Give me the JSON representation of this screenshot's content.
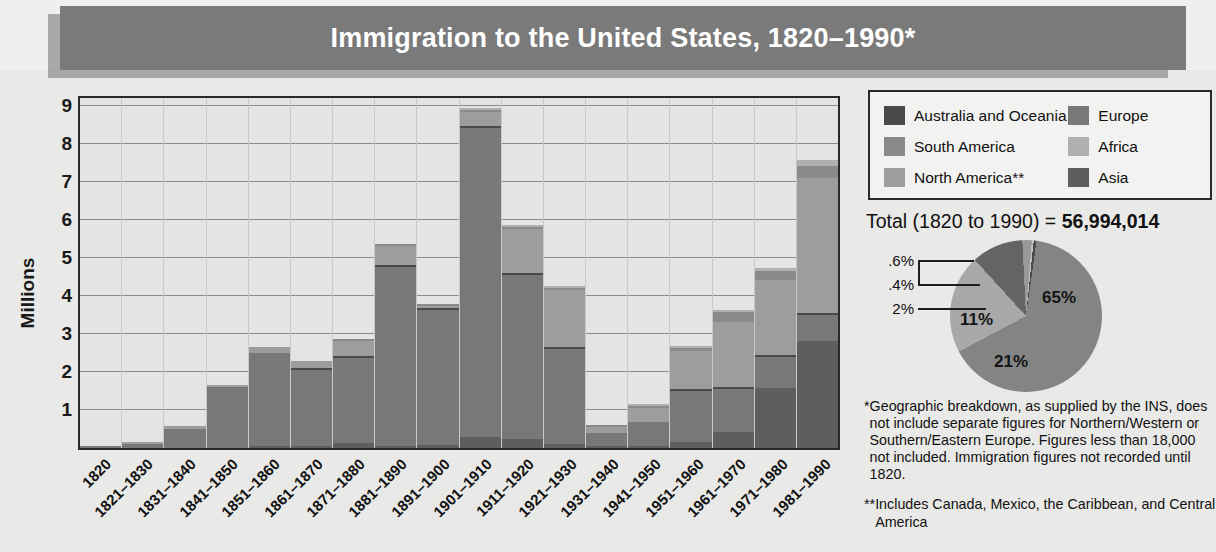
{
  "title": "Immigration to the United States, 1820–1990*",
  "axes": {
    "ylabel": "Millions",
    "yticks": [
      "9",
      "8",
      "7",
      "6",
      "5",
      "4",
      "3",
      "2",
      "1"
    ]
  },
  "legend": {
    "items": [
      {
        "label": "Australia and Oceania",
        "color": "#4a4a4a"
      },
      {
        "label": "Europe",
        "color": "#787878"
      },
      {
        "label": "South America",
        "color": "#8a8a8a"
      },
      {
        "label": "Africa",
        "color": "#b0b0b0"
      },
      {
        "label": "North America**",
        "color": "#9d9d9d"
      },
      {
        "label": "Asia",
        "color": "#5e5e5e"
      }
    ]
  },
  "total": {
    "prefix": "Total (1820 to 1990) = ",
    "value": "56,994,014"
  },
  "footnotes": [
    {
      "mark": "*",
      "text": "Geographic breakdown, as supplied by the INS, does not include separate figures for Northern/Western or Southern/Eastern Europe. Figures less than 18,000 not included. Immigration figures not recorded until 1820."
    },
    {
      "mark": "**",
      "text": "Includes Canada, Mexico, the Caribbean, and Central America"
    }
  ],
  "chart_data": [
    {
      "type": "bar",
      "subtype": "stacked",
      "title": "Immigration to the United States, 1820–1990*",
      "xlabel": "",
      "ylabel": "Millions",
      "ylim": [
        0,
        9.2
      ],
      "grid": true,
      "legend_position": "top-right",
      "categories": [
        "1820",
        "1821–1830",
        "1831–1840",
        "1841–1850",
        "1851–1860",
        "1861–1870",
        "1871–1880",
        "1881–1890",
        "1891–1900",
        "1901–1910",
        "1911–1920",
        "1921–1930",
        "1931–1940",
        "1941–1950",
        "1951–1960",
        "1961–1970",
        "1971–1980",
        "1981–1990"
      ],
      "series": [
        {
          "name": "Asia",
          "color": "#5e5e5e",
          "values": [
            0.0,
            0.0,
            0.0,
            0.0,
            0.04,
            0.06,
            0.12,
            0.06,
            0.07,
            0.3,
            0.25,
            0.11,
            0.02,
            0.04,
            0.15,
            0.43,
            1.59,
            2.8
          ]
        },
        {
          "name": "Europe",
          "color": "#787878",
          "values": [
            0.01,
            0.1,
            0.5,
            1.6,
            2.45,
            2.0,
            2.25,
            4.7,
            3.55,
            8.1,
            4.3,
            2.48,
            0.35,
            0.62,
            1.35,
            1.12,
            0.8,
            0.7
          ]
        },
        {
          "name": "Australia and Oceania",
          "color": "#4a4a4a",
          "values": [
            0.0,
            0.0,
            0.0,
            0.0,
            0.0,
            0.01,
            0.01,
            0.01,
            0.01,
            0.01,
            0.01,
            0.01,
            0.0,
            0.0,
            0.01,
            0.03,
            0.04,
            0.04
          ]
        },
        {
          "name": "North America**",
          "color": "#9d9d9d",
          "values": [
            0.0,
            0.02,
            0.08,
            0.06,
            0.16,
            0.17,
            0.4,
            0.5,
            0.04,
            0.38,
            1.15,
            1.52,
            0.16,
            0.38,
            1.0,
            1.72,
            1.98,
            3.55
          ]
        },
        {
          "name": "South America",
          "color": "#8a8a8a",
          "values": [
            0.0,
            0.0,
            0.0,
            0.0,
            0.0,
            0.0,
            0.01,
            0.01,
            0.01,
            0.02,
            0.04,
            0.04,
            0.01,
            0.02,
            0.08,
            0.26,
            0.24,
            0.3
          ]
        },
        {
          "name": "Africa",
          "color": "#b0b0b0",
          "values": [
            0.0,
            0.0,
            0.0,
            0.0,
            0.0,
            0.0,
            0.0,
            0.0,
            0.0,
            0.01,
            0.01,
            0.01,
            0.0,
            0.01,
            0.01,
            0.03,
            0.08,
            0.18
          ]
        }
      ],
      "totals": [
        0.01,
        0.14,
        0.6,
        1.71,
        2.6,
        2.31,
        2.81,
        5.25,
        3.69,
        8.8,
        5.76,
        4.11,
        0.53,
        1.04,
        2.51,
        3.21,
        4.49,
        7.34
      ]
    },
    {
      "type": "pie",
      "title": "Total (1820 to 1990) = 56,994,014",
      "labels": [
        "Europe",
        "North America**",
        "Asia",
        "South America",
        "Africa",
        "Australia and Oceania"
      ],
      "display_labels": [
        "65%",
        "21%",
        "11%",
        "2%",
        ".4%",
        ".6%"
      ],
      "values": [
        65,
        21,
        11,
        2,
        0.4,
        0.6
      ],
      "colors": [
        "#848484",
        "#a8a8a8",
        "#646464",
        "#9a9a9a",
        "#c0c0c0",
        "#4a4a4a"
      ],
      "callouts": [
        ".6%",
        ".4%",
        "2%"
      ]
    }
  ]
}
